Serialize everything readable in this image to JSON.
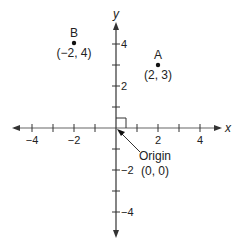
{
  "diagram": {
    "type": "coordinate-plane",
    "axes": {
      "x_label": "x",
      "y_label": "y",
      "x_range": [
        -5,
        5
      ],
      "y_range": [
        -5,
        5
      ],
      "x_tick_labels": [
        "−4",
        "−2",
        "2",
        "4"
      ],
      "y_tick_labels": [
        "4",
        "2",
        "−2",
        "−4"
      ]
    },
    "points": [
      {
        "name": "A",
        "coords": "(2, 3)",
        "x": 2,
        "y": 3
      },
      {
        "name": "B",
        "coords": "(−2, 4)",
        "x": -2,
        "y": 4
      }
    ],
    "origin": {
      "label": "Origin",
      "coords": "(0, 0)"
    },
    "colors": {
      "axis": "#333333",
      "text": "#222222",
      "background": "#ffffff"
    }
  }
}
